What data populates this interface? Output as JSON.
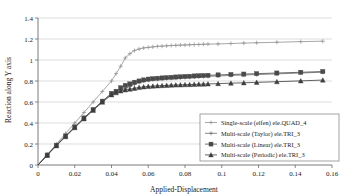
{
  "chart_data": {
    "type": "line",
    "title": "",
    "xlabel": "Applied-Displacement",
    "ylabel": "Reaction along Y axis",
    "xlim": [
      0,
      0.16
    ],
    "ylim": [
      0,
      1.4
    ],
    "xticks": [
      "0",
      "0.02",
      "0.04",
      "0.06",
      "0.08",
      "0.1",
      "0.12",
      "0.14",
      "0.16"
    ],
    "xtick_values": [
      0,
      0.02,
      0.04,
      0.06,
      0.08,
      0.1,
      0.12,
      0.14,
      0.16
    ],
    "yticks": [
      "0",
      "0.2",
      "0.4",
      "0.6",
      "0.8",
      "1",
      "1.2",
      "1.4"
    ],
    "ytick_values": [
      0,
      0.2,
      0.4,
      0.6,
      0.8,
      1.0,
      1.2,
      1.4
    ],
    "grid": "horizontal",
    "legend_position": "lower-right",
    "series": [
      {
        "name": "Single-scale (elfen) ele.QUAD_4",
        "marker": "cross",
        "color": "#8f8f8f",
        "x": [
          0,
          0.005,
          0.01,
          0.015,
          0.02,
          0.025,
          0.03,
          0.035,
          0.04,
          0.0425,
          0.045,
          0.0475,
          0.05,
          0.0525,
          0.055,
          0.0575,
          0.06,
          0.0625,
          0.065,
          0.0675,
          0.07,
          0.0725,
          0.075,
          0.0775,
          0.08,
          0.0825,
          0.085,
          0.0875,
          0.09,
          0.0925,
          0.098,
          0.105,
          0.112,
          0.119,
          0.13,
          0.143,
          0.155
        ],
        "y": [
          0.0,
          0.1,
          0.2,
          0.3,
          0.4,
          0.5,
          0.6,
          0.7,
          0.8,
          0.87,
          0.94,
          1.02,
          1.06,
          1.09,
          1.105,
          1.115,
          1.12,
          1.125,
          1.13,
          1.132,
          1.135,
          1.138,
          1.14,
          1.142,
          1.143,
          1.145,
          1.147,
          1.148,
          1.15,
          1.151,
          1.153,
          1.157,
          1.161,
          1.164,
          1.169,
          1.175,
          1.179
        ]
      },
      {
        "name": "Multi-scale (Taylor) ele.TRI_3",
        "marker": "cross",
        "color": "#6e6e6e",
        "x": [
          0,
          0.005,
          0.01,
          0.015,
          0.02,
          0.025,
          0.03,
          0.035,
          0.04,
          0.0425,
          0.045,
          0.0475,
          0.05,
          0.0525,
          0.055,
          0.0575,
          0.06,
          0.0625,
          0.065,
          0.0675,
          0.07,
          0.0725,
          0.075,
          0.0775,
          0.08,
          0.0825,
          0.085,
          0.0875,
          0.09,
          0.0925,
          0.098,
          0.105,
          0.112,
          0.119,
          0.13,
          0.143,
          0.155
        ],
        "y": [
          0.0,
          0.095,
          0.188,
          0.276,
          0.362,
          0.448,
          0.528,
          0.605,
          0.678,
          0.7,
          0.716,
          0.728,
          0.748,
          0.768,
          0.788,
          0.8,
          0.808,
          0.814,
          0.818,
          0.821,
          0.824,
          0.827,
          0.83,
          0.832,
          0.834,
          0.836,
          0.838,
          0.84,
          0.842,
          0.844,
          0.848,
          0.853,
          0.857,
          0.861,
          0.868,
          0.876,
          0.884
        ]
      },
      {
        "name": "Multi-scale (Linear) ele.TRI_3",
        "marker": "square",
        "color": "#4a4a4a",
        "x": [
          0,
          0.005,
          0.01,
          0.015,
          0.02,
          0.025,
          0.03,
          0.035,
          0.04,
          0.0425,
          0.045,
          0.0475,
          0.05,
          0.0525,
          0.055,
          0.0575,
          0.06,
          0.0625,
          0.065,
          0.0675,
          0.07,
          0.0725,
          0.075,
          0.0775,
          0.08,
          0.0825,
          0.085,
          0.0875,
          0.09,
          0.0925,
          0.098,
          0.105,
          0.112,
          0.119,
          0.13,
          0.143,
          0.155
        ],
        "y": [
          0.0,
          0.095,
          0.188,
          0.276,
          0.362,
          0.448,
          0.528,
          0.608,
          0.682,
          0.702,
          0.735,
          0.758,
          0.772,
          0.788,
          0.8,
          0.81,
          0.818,
          0.822,
          0.826,
          0.829,
          0.832,
          0.835,
          0.838,
          0.84,
          0.843,
          0.845,
          0.848,
          0.85,
          0.852,
          0.854,
          0.858,
          0.862,
          0.866,
          0.87,
          0.876,
          0.883,
          0.89
        ]
      },
      {
        "name": "Multi-scale (Periodic) ele.TRI_3",
        "marker": "triangle",
        "color": "#3d3d3d",
        "x": [
          0,
          0.005,
          0.01,
          0.015,
          0.02,
          0.025,
          0.03,
          0.035,
          0.04,
          0.0425,
          0.045,
          0.0475,
          0.05,
          0.0525,
          0.055,
          0.0575,
          0.06,
          0.0625,
          0.065,
          0.0675,
          0.07,
          0.0725,
          0.075,
          0.0775,
          0.08,
          0.0825,
          0.085,
          0.0875,
          0.09,
          0.0925,
          0.098,
          0.105,
          0.112,
          0.119,
          0.13,
          0.143,
          0.155
        ],
        "y": [
          0.0,
          0.092,
          0.183,
          0.27,
          0.355,
          0.44,
          0.52,
          0.598,
          0.668,
          0.688,
          0.705,
          0.715,
          0.722,
          0.73,
          0.738,
          0.744,
          0.748,
          0.751,
          0.754,
          0.756,
          0.758,
          0.76,
          0.762,
          0.763,
          0.765,
          0.766,
          0.768,
          0.769,
          0.77,
          0.772,
          0.775,
          0.779,
          0.783,
          0.787,
          0.793,
          0.801,
          0.809
        ]
      }
    ]
  }
}
